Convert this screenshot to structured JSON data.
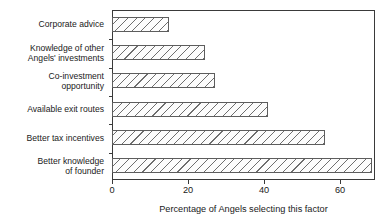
{
  "chart_data": {
    "type": "bar",
    "orientation": "horizontal",
    "title": "",
    "xlabel": "Percentage of Angels selecting this factor",
    "ylabel": "",
    "categories": [
      "Corporate advice",
      "Knowledge of other\nAngels' investments",
      "Co-investment\nopportunity",
      "Available exit routes",
      "Better tax incentives",
      "Better knowledge\nof founder"
    ],
    "values": [
      15,
      24.5,
      27,
      41,
      56,
      68.5
    ],
    "xlim": [
      0,
      69.2
    ],
    "xticks": [
      0,
      20,
      40,
      60
    ],
    "xtick_labels": [
      "0",
      "20",
      "40",
      "60"
    ],
    "grid": false,
    "legend": "none",
    "bar_fill": "#fcfcfc",
    "bar_hatch": "diagonal-lines",
    "bar_edge_color": "#5d5d5d",
    "frame_color": "#3a3a3a",
    "background": "#ffffff"
  }
}
